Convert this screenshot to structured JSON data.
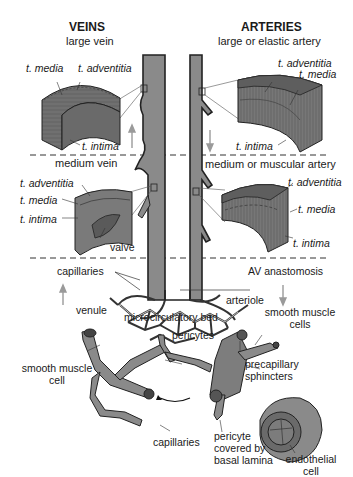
{
  "headers": {
    "veins": "VEINS",
    "arteries": "ARTERIES"
  },
  "sections": {
    "large_vein": "large vein",
    "large_artery": "large or elastic artery",
    "medium_vein": "medium vein",
    "medium_artery": "medium or muscular artery"
  },
  "large_vein_labels": {
    "media": "t. media",
    "adventitia": "t. adventitia",
    "intima": "t. intima"
  },
  "large_artery_labels": {
    "adventitia": "t. adventitia",
    "media": "t. media",
    "intima": "t. intima"
  },
  "medium_vein_labels": {
    "adventitia": "t. adventitia",
    "media": "t. media",
    "intima": "t. intima",
    "valve": "valve"
  },
  "medium_artery_labels": {
    "adventitia": "t. adventitia",
    "media": "t. media",
    "intima": "t. intima"
  },
  "micro_labels": {
    "capillaries": "capillaries",
    "av_anastomosis": "AV anastomosis",
    "microcirculatory_bed": "microcirculatory bed",
    "venule": "venule",
    "arteriole": "arteriole",
    "smooth_muscle_cells": "smooth muscle cells",
    "pericytes": "pericytes",
    "smooth_muscle_cell": "smooth muscle cell",
    "precapillary_sphincters": "precapillary sphincters",
    "capillaries_bottom": "capillaries",
    "pericyte_covered": "pericyte covered by basal lamina",
    "endothelial_cell": "endothelial cell"
  },
  "colors": {
    "vessel_fill": "#8a8a8a",
    "vessel_dark": "#3a3a3a",
    "tissue_fill": "#6e6e6e",
    "arrow": "#9a9a9a",
    "divider": "#333333"
  }
}
